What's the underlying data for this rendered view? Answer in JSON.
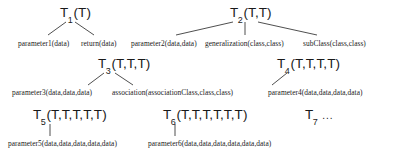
{
  "diagram": {
    "nodes": [
      {
        "id": "T1",
        "symbol": "T",
        "index": "1",
        "args": "(T)",
        "label": "T1(T)",
        "x": 60,
        "y": 6
      },
      {
        "id": "T2",
        "symbol": "T",
        "index": "2",
        "args": "(T,T)",
        "label": "T2(T,T)",
        "x": 230,
        "y": 6
      },
      {
        "id": "T3",
        "symbol": "T",
        "index": "3",
        "args": "(T,T,T)",
        "label": "T3(T,T,T)",
        "x": 98,
        "y": 57
      },
      {
        "id": "T4",
        "symbol": "T",
        "index": "4",
        "args": "(T,T,T,T)",
        "label": "T4(T,T,T,T)",
        "x": 277,
        "y": 57
      },
      {
        "id": "T5",
        "symbol": "T",
        "index": "5",
        "args": "(T,T,T,T,T)",
        "label": "T5(T,T,T,T,T)",
        "x": 33,
        "y": 108
      },
      {
        "id": "T6",
        "symbol": "T",
        "index": "6",
        "args": "(T,T,T,T,T,T)",
        "label": "T6(T,T,T,T,T,T)",
        "x": 163,
        "y": 108
      },
      {
        "id": "T7",
        "symbol": "T",
        "index": "7",
        "args": "",
        "label": "T7",
        "x": 305,
        "y": 108
      }
    ],
    "ellipsis": "...",
    "leaves": [
      {
        "id": "L1",
        "parent": "T1",
        "text": "parameter1(data)",
        "x": 18,
        "y": 40
      },
      {
        "id": "L2",
        "parent": "T1",
        "text": "return(data)",
        "x": 81,
        "y": 40
      },
      {
        "id": "L3",
        "parent": "T2",
        "text": "parameter2(data,data)",
        "x": 131,
        "y": 40
      },
      {
        "id": "L4",
        "parent": "T2",
        "text": "generalization(class,class)",
        "x": 205,
        "y": 40
      },
      {
        "id": "L5",
        "parent": "T2",
        "text": "subClass(class,class)",
        "x": 303,
        "y": 40
      },
      {
        "id": "L6",
        "parent": "T3",
        "text": "parameter3(data,data,data)",
        "x": 12,
        "y": 89
      },
      {
        "id": "L7",
        "parent": "T3",
        "text": "association(associationClass,class,class)",
        "x": 112,
        "y": 89
      },
      {
        "id": "L8",
        "parent": "T4",
        "text": "parameter4(data,data,data,data)",
        "x": 268,
        "y": 89
      },
      {
        "id": "L9",
        "parent": "T5",
        "text": "parameter5(data,data,data,data,data)",
        "x": 8,
        "y": 140
      },
      {
        "id": "L10",
        "parent": "T6",
        "text": "parameter6(data,data,data,data,data,data)",
        "x": 148,
        "y": 140
      }
    ],
    "edges": [
      {
        "from": "T1",
        "to": "L1",
        "x1": 66,
        "y1": 22,
        "x2": 48,
        "y2": 35
      },
      {
        "from": "T1",
        "to": "L2",
        "x1": 75,
        "y1": 22,
        "x2": 94,
        "y2": 35
      },
      {
        "from": "T2",
        "to": "L3",
        "x1": 233,
        "y1": 22,
        "x2": 176,
        "y2": 35
      },
      {
        "from": "T2",
        "to": "L4",
        "x1": 245,
        "y1": 22,
        "x2": 245,
        "y2": 35
      },
      {
        "from": "T2",
        "to": "L5",
        "x1": 258,
        "y1": 22,
        "x2": 317,
        "y2": 35
      },
      {
        "from": "T3",
        "to": "L6",
        "x1": 104,
        "y1": 73,
        "x2": 88,
        "y2": 85
      },
      {
        "from": "T3",
        "to": "L7",
        "x1": 115,
        "y1": 73,
        "x2": 133,
        "y2": 85
      },
      {
        "from": "T4",
        "to": "L8",
        "x1": 287,
        "y1": 73,
        "x2": 272,
        "y2": 85
      },
      {
        "from": "T5",
        "to": "L9",
        "x1": 50,
        "y1": 124,
        "x2": 50,
        "y2": 136
      },
      {
        "from": "T6",
        "to": "L10",
        "x1": 175,
        "y1": 124,
        "x2": 175,
        "y2": 136
      }
    ],
    "colors": {
      "background": "#ffffff",
      "text": "#1a1a1a",
      "line": "#222222"
    }
  }
}
